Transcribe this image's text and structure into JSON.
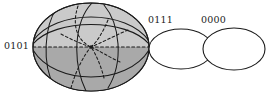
{
  "figure": {
    "kind": "mathematical-diagram",
    "background_color": "#ffffff",
    "stroke_color": "#1b1b1b",
    "labels": [
      {
        "id": "0101",
        "text": "0101",
        "x": 4,
        "y": 41,
        "attached_to": "shaded-ellipsoid"
      },
      {
        "id": "0111",
        "text": "0111",
        "x": 148,
        "y": 15,
        "attached_to": "middle-ellipse"
      },
      {
        "id": "0000",
        "text": "0000",
        "x": 201,
        "y": 15,
        "attached_to": "right-ellipse"
      }
    ],
    "shapes": [
      {
        "name": "shaded-ellipsoid",
        "type": "ellipse",
        "cx": 91,
        "cy": 47,
        "rx": 58,
        "ry": 44,
        "fill_upper": "#c9c9c9",
        "fill_lower": "#a8a8a8",
        "stroke": "#1b1b1b",
        "description": "shaded ellipsoid with solid visible meridians, dashed hidden meridians, curved latitude bands and a dashed equator"
      },
      {
        "name": "middle-ellipse",
        "type": "ellipse",
        "cx": 181,
        "cy": 49,
        "rx": 32,
        "ry": 20,
        "fill": "#ffffff",
        "stroke": "#1b1b1b"
      },
      {
        "name": "right-ellipse",
        "type": "ellipse",
        "cx": 234,
        "cy": 49,
        "rx": 31,
        "ry": 21,
        "fill": "#ffffff",
        "stroke": "#1b1b1b"
      }
    ],
    "equator": {
      "name": "dashed-equator",
      "style": "dashed",
      "y": 47,
      "x_start": 33,
      "x_end": 149
    },
    "center_node": {
      "x": 91,
      "y": 47,
      "radius": 1.6
    }
  }
}
